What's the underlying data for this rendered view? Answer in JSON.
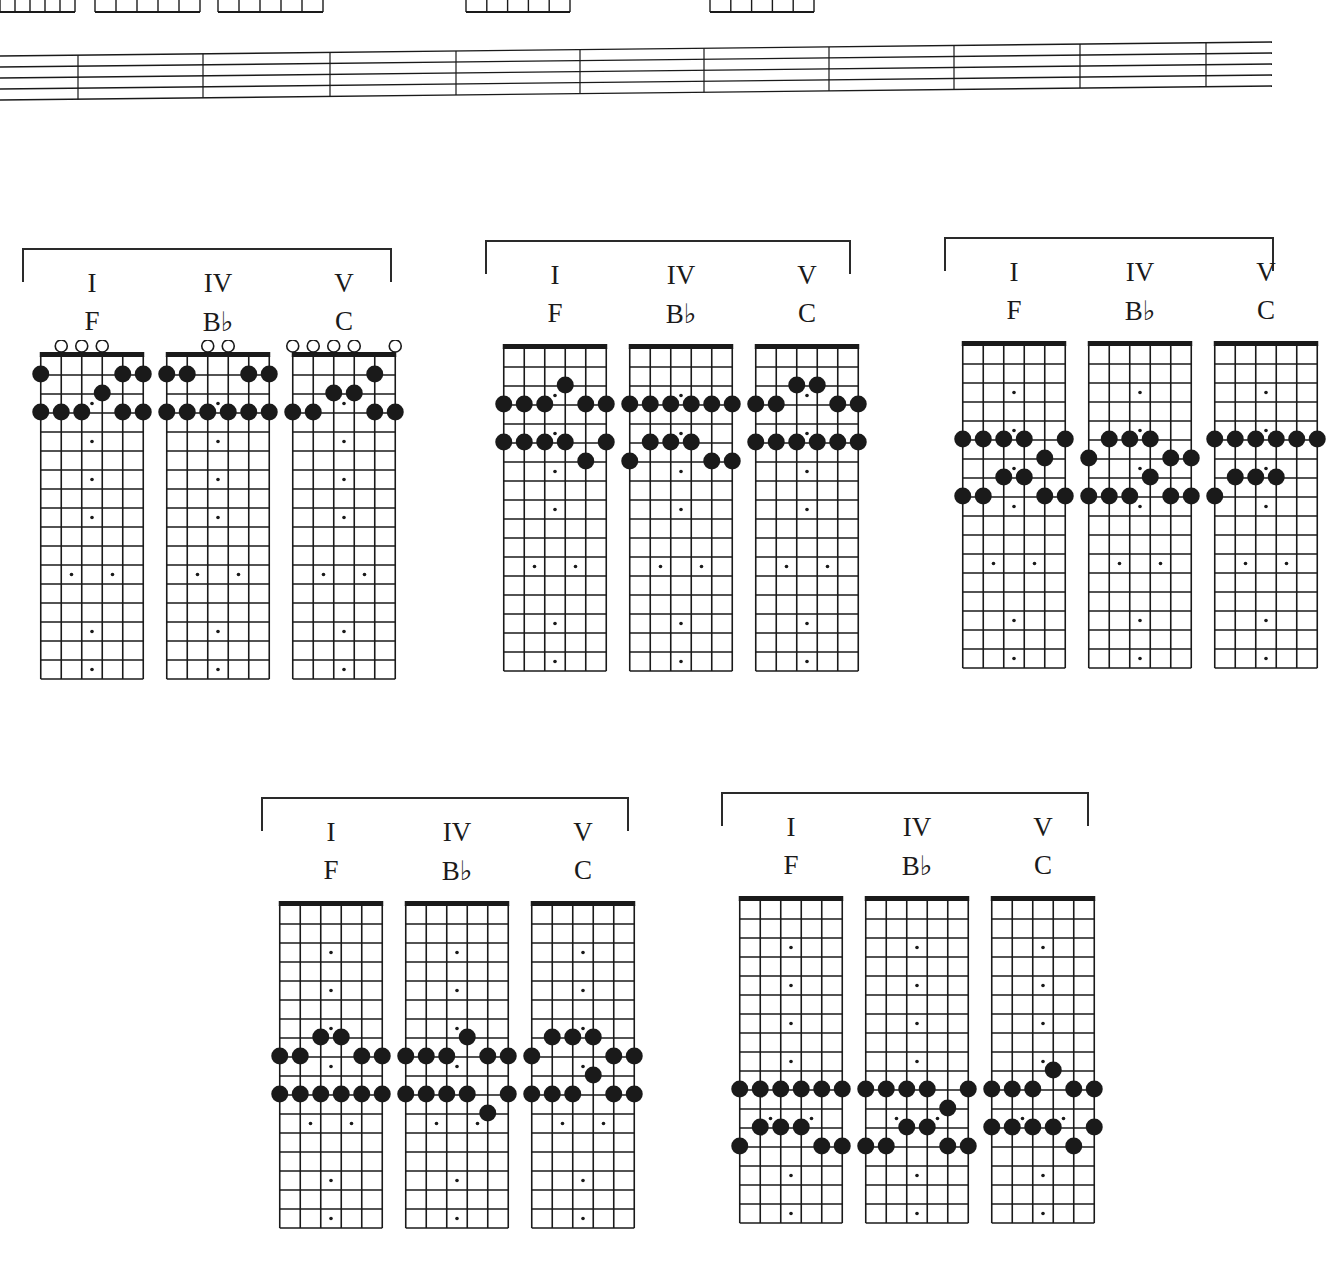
{
  "page": {
    "background": "#ffffff",
    "ink": "#1a1a1a",
    "frets_per_board": 17,
    "strings": 6,
    "inlay_frets_single": [
      3,
      5,
      7,
      9,
      15,
      17
    ],
    "inlay_frets_double": [
      12
    ]
  },
  "labels": {
    "numeral_I": "I",
    "numeral_IV": "IV",
    "numeral_V": "V",
    "chord_F": "F",
    "chord_Bb": "B♭",
    "chord_C": "C"
  },
  "groups": [
    {
      "id": "group-1",
      "position": "open",
      "x": 22,
      "y": 248,
      "width": 370,
      "chords": [
        {
          "numeral": "I",
          "name": "F",
          "open": [
            2,
            3,
            4
          ],
          "notes": [
            [
              1,
              1
            ],
            [
              1,
              5
            ],
            [
              1,
              6
            ],
            [
              2,
              4
            ],
            [
              3,
              1
            ],
            [
              3,
              2
            ],
            [
              3,
              3
            ],
            [
              3,
              5
            ],
            [
              3,
              6
            ]
          ]
        },
        {
          "numeral": "IV",
          "name": "B♭",
          "open": [
            3,
            4
          ],
          "notes": [
            [
              1,
              1
            ],
            [
              1,
              2
            ],
            [
              1,
              5
            ],
            [
              1,
              6
            ],
            [
              3,
              1
            ],
            [
              3,
              2
            ],
            [
              3,
              3
            ],
            [
              3,
              4
            ],
            [
              3,
              5
            ],
            [
              3,
              6
            ]
          ]
        },
        {
          "numeral": "V",
          "name": "C",
          "open": [
            1,
            2,
            3,
            4,
            6
          ],
          "notes": [
            [
              1,
              5
            ],
            [
              2,
              3
            ],
            [
              2,
              4
            ],
            [
              3,
              1
            ],
            [
              3,
              2
            ],
            [
              3,
              5
            ],
            [
              3,
              6
            ]
          ]
        }
      ]
    },
    {
      "id": "group-2",
      "position": "2nd-6th",
      "x": 485,
      "y": 240,
      "width": 366,
      "chords": [
        {
          "numeral": "I",
          "name": "F",
          "open": [],
          "notes": [
            [
              2,
              4
            ],
            [
              3,
              1
            ],
            [
              3,
              2
            ],
            [
              3,
              3
            ],
            [
              3,
              5
            ],
            [
              3,
              6
            ],
            [
              5,
              1
            ],
            [
              5,
              2
            ],
            [
              5,
              3
            ],
            [
              5,
              4
            ],
            [
              5,
              6
            ],
            [
              6,
              5
            ]
          ]
        },
        {
          "numeral": "IV",
          "name": "B♭",
          "open": [],
          "notes": [
            [
              3,
              1
            ],
            [
              3,
              2
            ],
            [
              3,
              3
            ],
            [
              3,
              4
            ],
            [
              3,
              5
            ],
            [
              3,
              6
            ],
            [
              5,
              2
            ],
            [
              5,
              3
            ],
            [
              5,
              4
            ],
            [
              6,
              1
            ],
            [
              6,
              5
            ],
            [
              6,
              6
            ]
          ]
        },
        {
          "numeral": "V",
          "name": "C",
          "open": [],
          "notes": [
            [
              2,
              3
            ],
            [
              2,
              4
            ],
            [
              3,
              1
            ],
            [
              3,
              2
            ],
            [
              3,
              5
            ],
            [
              3,
              6
            ],
            [
              5,
              1
            ],
            [
              5,
              2
            ],
            [
              5,
              3
            ],
            [
              5,
              4
            ],
            [
              5,
              5
            ],
            [
              5,
              6
            ]
          ]
        }
      ]
    },
    {
      "id": "group-3",
      "position": "5th-8th",
      "x": 944,
      "y": 237,
      "width": 330,
      "chords": [
        {
          "numeral": "I",
          "name": "F",
          "open": [],
          "notes": [
            [
              5,
              1
            ],
            [
              5,
              2
            ],
            [
              5,
              3
            ],
            [
              5,
              4
            ],
            [
              5,
              6
            ],
            [
              6,
              5
            ],
            [
              7,
              3
            ],
            [
              7,
              4
            ],
            [
              8,
              1
            ],
            [
              8,
              2
            ],
            [
              8,
              5
            ],
            [
              8,
              6
            ]
          ]
        },
        {
          "numeral": "IV",
          "name": "B♭",
          "open": [],
          "notes": [
            [
              5,
              2
            ],
            [
              5,
              3
            ],
            [
              5,
              4
            ],
            [
              6,
              1
            ],
            [
              6,
              5
            ],
            [
              6,
              6
            ],
            [
              7,
              4
            ],
            [
              8,
              1
            ],
            [
              8,
              2
            ],
            [
              8,
              3
            ],
            [
              8,
              5
            ],
            [
              8,
              6
            ]
          ]
        },
        {
          "numeral": "V",
          "name": "C",
          "open": [],
          "notes": [
            [
              5,
              1
            ],
            [
              5,
              2
            ],
            [
              5,
              3
            ],
            [
              5,
              4
            ],
            [
              5,
              5
            ],
            [
              5,
              6
            ],
            [
              7,
              2
            ],
            [
              7,
              3
            ],
            [
              7,
              4
            ],
            [
              8,
              1
            ]
          ]
        }
      ]
    },
    {
      "id": "group-4",
      "position": "7th-11th",
      "x": 261,
      "y": 797,
      "width": 368,
      "chords": [
        {
          "numeral": "I",
          "name": "F",
          "open": [],
          "notes": [
            [
              7,
              3
            ],
            [
              7,
              4
            ],
            [
              8,
              1
            ],
            [
              8,
              2
            ],
            [
              8,
              5
            ],
            [
              8,
              6
            ],
            [
              10,
              1
            ],
            [
              10,
              2
            ],
            [
              10,
              3
            ],
            [
              10,
              4
            ],
            [
              10,
              5
            ],
            [
              10,
              6
            ]
          ]
        },
        {
          "numeral": "IV",
          "name": "B♭",
          "open": [],
          "notes": [
            [
              7,
              4
            ],
            [
              8,
              1
            ],
            [
              8,
              2
            ],
            [
              8,
              3
            ],
            [
              8,
              5
            ],
            [
              8,
              6
            ],
            [
              10,
              1
            ],
            [
              10,
              2
            ],
            [
              10,
              3
            ],
            [
              10,
              4
            ],
            [
              10,
              6
            ],
            [
              11,
              5
            ]
          ]
        },
        {
          "numeral": "V",
          "name": "C",
          "open": [],
          "notes": [
            [
              7,
              2
            ],
            [
              7,
              3
            ],
            [
              7,
              4
            ],
            [
              8,
              1
            ],
            [
              8,
              5
            ],
            [
              8,
              6
            ],
            [
              9,
              4
            ],
            [
              10,
              1
            ],
            [
              10,
              2
            ],
            [
              10,
              3
            ],
            [
              10,
              5
            ],
            [
              10,
              6
            ]
          ]
        }
      ]
    },
    {
      "id": "group-5",
      "position": "9th-13th",
      "x": 721,
      "y": 792,
      "width": 368,
      "chords": [
        {
          "numeral": "I",
          "name": "F",
          "open": [],
          "notes": [
            [
              10,
              1
            ],
            [
              10,
              2
            ],
            [
              10,
              3
            ],
            [
              10,
              4
            ],
            [
              10,
              5
            ],
            [
              10,
              6
            ],
            [
              12,
              2
            ],
            [
              12,
              3
            ],
            [
              12,
              4
            ],
            [
              13,
              1
            ],
            [
              13,
              5
            ],
            [
              13,
              6
            ]
          ]
        },
        {
          "numeral": "IV",
          "name": "B♭",
          "open": [],
          "notes": [
            [
              10,
              1
            ],
            [
              10,
              2
            ],
            [
              10,
              3
            ],
            [
              10,
              4
            ],
            [
              10,
              6
            ],
            [
              11,
              5
            ],
            [
              12,
              3
            ],
            [
              12,
              4
            ],
            [
              13,
              1
            ],
            [
              13,
              2
            ],
            [
              13,
              5
            ],
            [
              13,
              6
            ]
          ]
        },
        {
          "numeral": "V",
          "name": "C",
          "open": [],
          "notes": [
            [
              9,
              4
            ],
            [
              10,
              1
            ],
            [
              10,
              2
            ],
            [
              10,
              3
            ],
            [
              10,
              5
            ],
            [
              10,
              6
            ],
            [
              12,
              1
            ],
            [
              12,
              2
            ],
            [
              12,
              3
            ],
            [
              12,
              4
            ],
            [
              12,
              6
            ],
            [
              13,
              5
            ]
          ]
        }
      ]
    }
  ],
  "staff": {
    "lines": 5,
    "measures": 10,
    "barline_x": [
      78,
      203,
      330,
      456,
      580,
      704,
      829,
      954,
      1080,
      1206
    ]
  },
  "top_partial_boards": [
    {
      "x": 0,
      "w": 75
    },
    {
      "x": 95,
      "w": 105
    },
    {
      "x": 218,
      "w": 105
    },
    {
      "x": 466,
      "w": 104
    },
    {
      "x": 710,
      "w": 104
    }
  ]
}
